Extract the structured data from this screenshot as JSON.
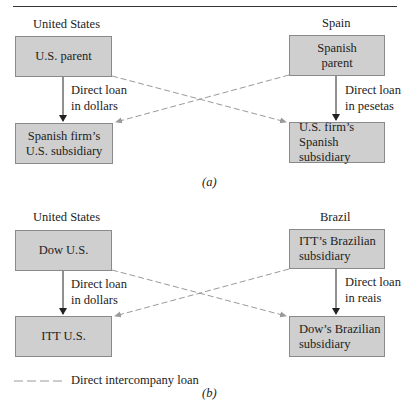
{
  "diagram_a": {
    "caption": "(a)",
    "left_country": "United States",
    "right_country": "Spain",
    "top_left_box": {
      "line1": "U.S. parent",
      "line2": ""
    },
    "top_right_box": {
      "line1": "Spanish",
      "line2": "parent"
    },
    "bottom_left_box": {
      "line1": "Spanish firm’s",
      "line2": "U.S. subsidiary"
    },
    "bottom_right_box": {
      "line1": "U.S. firm’s",
      "line2": "Spanish subsidiary"
    },
    "left_loan": {
      "line1": "Direct loan",
      "line2": "in dollars"
    },
    "right_loan": {
      "line1": "Direct loan",
      "line2": "in pesetas"
    }
  },
  "diagram_b": {
    "caption": "(b)",
    "left_country": "United States",
    "right_country": "Brazil",
    "top_left_box": {
      "line1": "Dow U.S.",
      "line2": ""
    },
    "top_right_box": {
      "line1": "ITT’s Brazilian",
      "line2": "subsidiary"
    },
    "bottom_left_box": {
      "line1": "ITT U.S.",
      "line2": ""
    },
    "bottom_right_box": {
      "line1": "Dow’s Brazilian",
      "line2": "subsidiary"
    },
    "left_loan": {
      "line1": "Direct loan",
      "line2": "in dollars"
    },
    "right_loan": {
      "line1": "Direct loan",
      "line2": "in reais"
    }
  },
  "legend": {
    "dashed_line_label": "Direct intercompany loan"
  },
  "colors": {
    "box_fill": "#cfcfcf",
    "box_border": "#8a8a8a",
    "solid_arrow": "#222222",
    "dashed_arrow": "#9a9a9a"
  }
}
